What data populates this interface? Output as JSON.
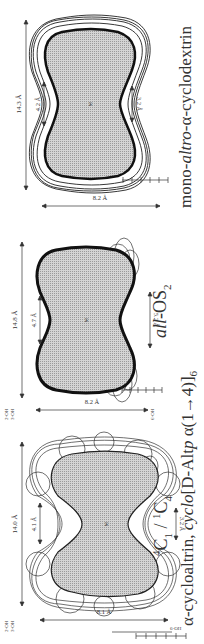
{
  "figure": {
    "orientation": "rotated 90deg counter-clockwise",
    "panels": [
      {
        "id": "alpha-cycloaltrin",
        "conformation_label": "4C1 / 1C4",
        "conformation": {
          "a_sup": "4",
          "a_main": "C",
          "a_sub": "1",
          "sep": " / ",
          "b_sup": "1",
          "b_main": "C",
          "b_sub": "4"
        },
        "name_line": {
          "prefix": "α-cycloaltrin, ",
          "italic": "cyclo",
          "rest": "[D-Alt"
        },
        "dimensions": {
          "width": "14.0 Å",
          "inner_top": "4.1 Å",
          "inner_bottom": "3.2 Å",
          "height": "8.1 Å"
        },
        "hydroxyl_labels": [
          "2-OH",
          "3-OH",
          "6-OH"
        ],
        "center_label": "M",
        "scale_bar": {
          "ticks": [
            "0",
            "1",
            "2",
            "3",
            "4",
            "5"
          ],
          "unit": "Å"
        }
      },
      {
        "id": "all-OS2",
        "conformation_label": "all-OS2",
        "conformation": {
          "italic": "all",
          "main": "-OS",
          "sub": "2"
        },
        "name_line": {
          "italic_p": "p",
          "text_a": "[D-Alt",
          "text_b": " α(1→4)]",
          "sub": "6"
        },
        "dimensions": {
          "width": "14.8 Å",
          "inner_top": "4.7 Å",
          "inner_bottom": "5.2 Å",
          "height": "8.2 Å"
        },
        "hydroxyl_labels": [
          "2-OH",
          "3-OH",
          "6-OH"
        ],
        "center_label": "M",
        "scale_bar": {
          "ticks": [
            "0",
            "1",
            "2",
            "3",
            "4",
            "5"
          ],
          "unit": "Å"
        }
      },
      {
        "id": "mono-altro-alpha-cyclodextrin",
        "caption": {
          "prefix": "mono-",
          "italic": "altro",
          "suffix": "-α-cyclodextrin"
        },
        "dimensions": {
          "width": "14.3 Å",
          "inner_top": "4.2 Å",
          "inner_bottom": "3.2 Å",
          "height": "8.2 Å"
        },
        "center_label": "M",
        "scale_bar": {
          "ticks": [
            "0",
            "1",
            "2",
            "3",
            "4",
            "5"
          ],
          "unit": "Å"
        }
      }
    ],
    "shared_caption": {
      "line2_full": "α-cycloaltrin, cyclo[D-Altp α(1→4)]6"
    },
    "colors": {
      "fill": "#c8c8c8",
      "outline": "#1a1a1a",
      "background": "#ffffff"
    }
  }
}
